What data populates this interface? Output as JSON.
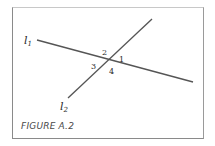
{
  "figure": {
    "caption": "FIGURE A.2",
    "lines": [
      {
        "name": "l1",
        "label": "l",
        "subscript": "1",
        "from": [
          37,
          40
        ],
        "to": [
          193,
          82
        ]
      },
      {
        "name": "l2",
        "label": "l",
        "subscript": "2",
        "from": [
          152,
          19
        ],
        "to": [
          68,
          98
        ]
      }
    ],
    "angles": [
      {
        "label": "2",
        "x": 102,
        "y": 55
      },
      {
        "label": "1",
        "x": 119,
        "y": 62
      },
      {
        "label": "3",
        "x": 92,
        "y": 67
      },
      {
        "label": "4",
        "x": 110,
        "y": 73
      }
    ],
    "colors": {
      "line": "#555555",
      "frame": "#8a8a8a",
      "text": "#2a2a2a",
      "caption": "#4a4a4a"
    }
  }
}
